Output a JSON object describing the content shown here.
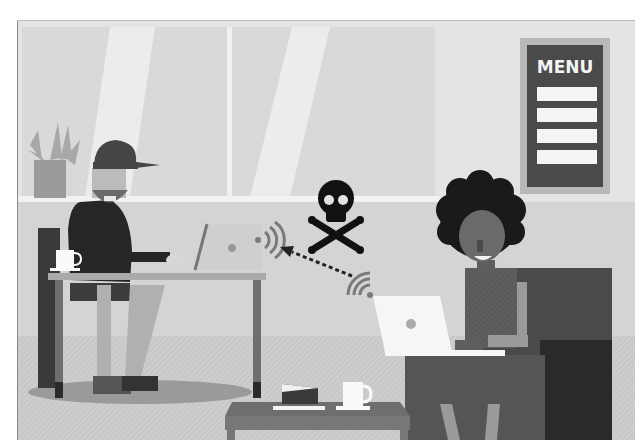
{
  "illustration": {
    "subject": "Public Wi-Fi security risk in a cafe",
    "menu_sign": {
      "title": "MENU",
      "line_count": 4
    },
    "characters": [
      {
        "id": "hacker",
        "description": "bearded man in cap at laptop",
        "position": "left"
      },
      {
        "id": "victim",
        "description": "woman with curly hair at laptop",
        "position": "right"
      }
    ],
    "threat_icon": "skull-crossbones-icon",
    "connection": {
      "from": "victim-laptop",
      "to": "hacker-laptop",
      "style": "dotted-arrow"
    },
    "colors": {
      "wall": "#dcdcdc",
      "window": "#e6e6e6",
      "floor": "#c9c9c9",
      "dark": "#2c2c2c",
      "mid": "#5e5e5e",
      "light": "#f7f7f7",
      "menu_board": "#4a4a4a",
      "wifi": "#7a7a7a"
    }
  }
}
